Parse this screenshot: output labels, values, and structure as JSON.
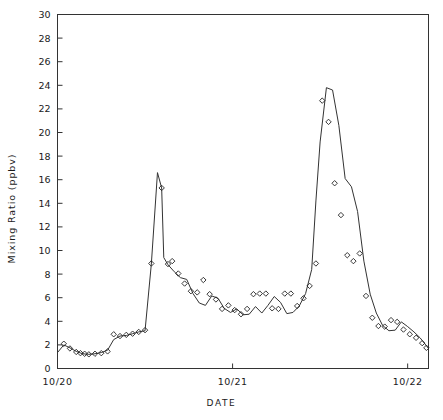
{
  "chart_data": {
    "type": "line",
    "title": "",
    "xlabel": "DATE",
    "ylabel": "Mixing Ratio (ppbv)",
    "ylim": [
      0,
      30
    ],
    "yticks": [
      0,
      2,
      4,
      6,
      8,
      10,
      12,
      14,
      16,
      18,
      20,
      22,
      24,
      26,
      28,
      30
    ],
    "ytick_labels": [
      "0",
      "2",
      "4",
      "6",
      "8",
      "10",
      "12",
      "14",
      "16",
      "18",
      "20",
      "22",
      "24",
      "26",
      "28",
      "30"
    ],
    "xlim": [
      0,
      2.1190476
    ],
    "xticks": [
      0.0,
      1.0,
      2.0
    ],
    "xtick_labels": [
      "10/20",
      "10/21",
      "10/22"
    ],
    "grid": false,
    "legend": null,
    "series": [
      {
        "name": "model-line",
        "marker": "none",
        "style": "solid",
        "color": "#333333",
        "x": [
          0.0,
          0.036,
          0.071,
          0.107,
          0.143,
          0.179,
          0.214,
          0.25,
          0.286,
          0.321,
          0.357,
          0.393,
          0.429,
          0.464,
          0.5,
          0.536,
          0.571,
          0.595,
          0.607,
          0.631,
          0.667,
          0.702,
          0.738,
          0.774,
          0.81,
          0.845,
          0.881,
          0.917,
          0.952,
          0.988,
          1.024,
          1.06,
          1.095,
          1.131,
          1.167,
          1.202,
          1.238,
          1.274,
          1.31,
          1.345,
          1.381,
          1.417,
          1.452,
          1.476,
          1.5,
          1.536,
          1.571,
          1.607,
          1.643,
          1.679,
          1.714,
          1.75,
          1.786,
          1.821,
          1.857,
          1.893,
          1.929,
          1.964,
          2.0,
          2.036,
          2.071,
          2.119
        ],
        "y": [
          1.35,
          2.0,
          1.75,
          1.45,
          1.25,
          1.2,
          1.25,
          1.35,
          1.55,
          2.45,
          2.75,
          2.8,
          2.95,
          3.1,
          3.2,
          8.85,
          16.6,
          15.3,
          9.4,
          8.8,
          8.2,
          7.7,
          7.55,
          6.35,
          5.55,
          5.35,
          6.15,
          5.95,
          5.1,
          4.75,
          5.05,
          4.55,
          4.6,
          5.25,
          4.7,
          5.35,
          6.1,
          5.6,
          4.65,
          4.75,
          5.3,
          6.35,
          8.4,
          14.2,
          19.2,
          23.8,
          23.6,
          20.6,
          16.1,
          15.4,
          13.3,
          9.1,
          6.3,
          4.7,
          3.65,
          3.2,
          3.25,
          3.95,
          3.55,
          3.1,
          2.6,
          1.7
        ]
      },
      {
        "name": "observations",
        "marker": "diamond",
        "style": "none",
        "color": "#222222",
        "x": [
          0.036,
          0.071,
          0.107,
          0.131,
          0.155,
          0.179,
          0.214,
          0.25,
          0.286,
          0.321,
          0.357,
          0.393,
          0.429,
          0.464,
          0.5,
          0.536,
          0.595,
          0.631,
          0.655,
          0.69,
          0.726,
          0.762,
          0.798,
          0.833,
          0.869,
          0.905,
          0.94,
          0.976,
          1.012,
          1.048,
          1.083,
          1.119,
          1.155,
          1.19,
          1.226,
          1.262,
          1.298,
          1.333,
          1.369,
          1.405,
          1.44,
          1.476,
          1.512,
          1.548,
          1.583,
          1.619,
          1.655,
          1.69,
          1.726,
          1.762,
          1.798,
          1.833,
          1.869,
          1.905,
          1.94,
          1.976,
          2.012,
          2.048,
          2.083,
          2.107
        ],
        "y": [
          2.1,
          1.7,
          1.4,
          1.3,
          1.25,
          1.2,
          1.25,
          1.3,
          1.45,
          2.9,
          2.75,
          2.85,
          2.95,
          3.1,
          3.25,
          8.9,
          15.3,
          8.85,
          9.1,
          8.05,
          7.2,
          6.55,
          6.45,
          7.5,
          6.3,
          5.85,
          5.05,
          5.35,
          4.95,
          4.6,
          5.05,
          6.3,
          6.35,
          6.35,
          5.1,
          5.05,
          6.35,
          6.35,
          5.3,
          5.95,
          7.0,
          8.9,
          22.7,
          20.9,
          15.7,
          13.0,
          9.6,
          9.1,
          9.75,
          6.15,
          4.3,
          3.6,
          3.55,
          4.1,
          3.95,
          3.3,
          2.9,
          2.6,
          2.15,
          1.75
        ]
      }
    ]
  },
  "axes": {
    "frame_color": "#333333",
    "tick_color": "#333333",
    "background": "#ffffff"
  }
}
